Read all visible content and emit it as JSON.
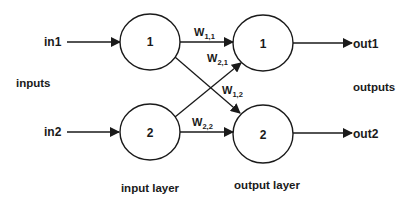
{
  "diagram": {
    "colors": {
      "stroke": "#1a1a1a",
      "background": "#ffffff"
    },
    "inputs": [
      {
        "label": "in1"
      },
      {
        "label": "in2"
      }
    ],
    "outputs": [
      {
        "label": "out1"
      },
      {
        "label": "out2"
      }
    ],
    "input_nodes": [
      {
        "label": "1"
      },
      {
        "label": "2"
      }
    ],
    "output_nodes": [
      {
        "label": "1"
      },
      {
        "label": "2"
      }
    ],
    "weights": [
      {
        "base": "W",
        "sub": "1,1",
        "from": "input 1",
        "to": "output 1"
      },
      {
        "base": "W",
        "sub": "2,1",
        "from": "input 2",
        "to": "output 1"
      },
      {
        "base": "W",
        "sub": "1,2",
        "from": "input 1",
        "to": "output 2"
      },
      {
        "base": "W",
        "sub": "2,2",
        "from": "input 2",
        "to": "output 2"
      }
    ],
    "group_labels": {
      "inputs": "inputs",
      "outputs": "outputs",
      "input_layer": "input layer",
      "output_layer": "output layer"
    }
  }
}
